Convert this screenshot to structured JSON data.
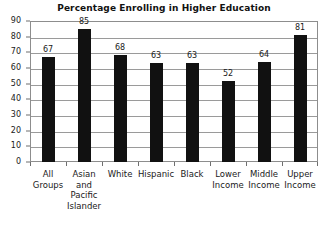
{
  "chart_data": {
    "type": "bar",
    "title": "Percentage Enrolling in Higher Education",
    "xlabel": "",
    "ylabel": "",
    "ylim": [
      0,
      90
    ],
    "ytick_step": 10,
    "yticks": [
      0,
      10,
      20,
      30,
      40,
      50,
      60,
      70,
      80,
      90
    ],
    "grid": true,
    "legend": "none",
    "bar_color": "#111111",
    "gridline_color": "#9a9a9a",
    "frame_color": "#8d8d8d",
    "background_color": "#ffffff",
    "show_value_labels": true,
    "categories": [
      "All Groups",
      "Asian and Pacific Islander",
      "White",
      "Hispanic",
      "Black",
      "Lower Income",
      "Middle Income",
      "Upper Income"
    ],
    "category_label_lines": [
      [
        "All",
        "Groups"
      ],
      [
        "Asian",
        "and",
        "Pacific",
        "Islander"
      ],
      [
        "White"
      ],
      [
        "Hispanic"
      ],
      [
        "Black"
      ],
      [
        "Lower",
        "Income"
      ],
      [
        "Middle",
        "Income"
      ],
      [
        "Upper",
        "Income"
      ]
    ],
    "values": [
      67,
      85,
      68,
      63,
      63,
      52,
      64,
      81
    ]
  }
}
